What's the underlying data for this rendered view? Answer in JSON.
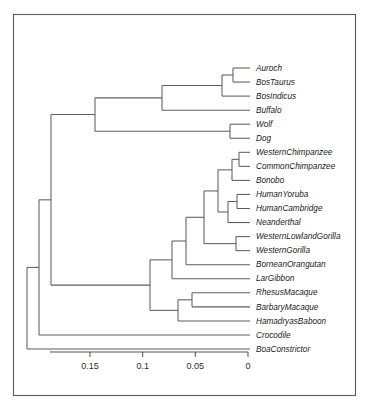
{
  "figure": {
    "kind": "phylogenetic-tree",
    "orientation": "right-to-left",
    "frame": {
      "visible": true,
      "color": "#5a5a5a"
    },
    "branch_color": "#5e5e5e"
  },
  "chart_data": {
    "type": "tree",
    "title": "",
    "xlabel": "",
    "ylabel": "",
    "grid": false,
    "legend": null,
    "axis": {
      "orientation": "horizontal",
      "reversed": true,
      "ticks": [
        0.15,
        0.1,
        0.05,
        0
      ],
      "tick_labels": [
        "0.15",
        "0.1",
        "0.05",
        "0"
      ],
      "range": [
        0.17,
        0.0
      ],
      "units": "substitutions per site"
    },
    "tips": [
      {
        "label": "Auroch",
        "depth": 0.0
      },
      {
        "label": "BosTaurus",
        "depth": 0.0
      },
      {
        "label": "BosIndicus",
        "depth": 0.0
      },
      {
        "label": "Buffalo",
        "depth": 0.0
      },
      {
        "label": "Wolf",
        "depth": 0.0
      },
      {
        "label": "Dog",
        "depth": 0.0
      },
      {
        "label": "WesternChimpanzee",
        "depth": 0.0
      },
      {
        "label": "CommonChimpanzee",
        "depth": 0.0
      },
      {
        "label": "Bonobo",
        "depth": 0.0
      },
      {
        "label": "HumanYoruba",
        "depth": 0.0
      },
      {
        "label": "HumanCambridge",
        "depth": 0.0
      },
      {
        "label": "Neanderthal",
        "depth": 0.0
      },
      {
        "label": "WesternLowlandGorilla",
        "depth": 0.0
      },
      {
        "label": "WesternGorilla",
        "depth": 0.0
      },
      {
        "label": "BorneanOrangutan",
        "depth": 0.0
      },
      {
        "label": "LarGibbon",
        "depth": 0.0
      },
      {
        "label": "RhesusMacaque",
        "depth": 0.0
      },
      {
        "label": "BarbaryMacaque",
        "depth": 0.0
      },
      {
        "label": "HamadryasBaboon",
        "depth": 0.0
      },
      {
        "label": "Crocodile",
        "depth": 0.0
      },
      {
        "label": "BoaConstrictor",
        "depth": 0.0
      }
    ],
    "clades": [
      {
        "name": "bovids",
        "members": [
          "Auroch",
          "BosTaurus",
          "BosIndicus",
          "Buffalo"
        ]
      },
      {
        "name": "bos",
        "members": [
          "Auroch",
          "BosTaurus",
          "BosIndicus"
        ]
      },
      {
        "name": "canids",
        "members": [
          "Wolf",
          "Dog"
        ]
      },
      {
        "name": "chimpanzees",
        "members": [
          "WesternChimpanzee",
          "CommonChimpanzee"
        ]
      },
      {
        "name": "pan",
        "members": [
          "WesternChimpanzee",
          "CommonChimpanzee",
          "Bonobo"
        ]
      },
      {
        "name": "homo",
        "members": [
          "HumanYoruba",
          "HumanCambridge",
          "Neanderthal"
        ]
      },
      {
        "name": "gorillas",
        "members": [
          "WesternLowlandGorilla",
          "WesternGorilla"
        ]
      },
      {
        "name": "macaques",
        "members": [
          "RhesusMacaque",
          "BarbaryMacaque"
        ]
      },
      {
        "name": "cercopithecids",
        "members": [
          "RhesusMacaque",
          "BarbaryMacaque",
          "HamadryasBaboon"
        ]
      },
      {
        "name": "reptiles",
        "members": [
          "Crocodile",
          "BoaConstrictor"
        ]
      }
    ]
  }
}
